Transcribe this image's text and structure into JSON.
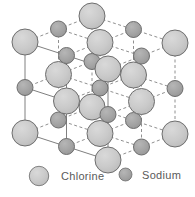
{
  "figure": {
    "type": "ball-and-stick-lattice",
    "projection": "isometric",
    "background": "#ffffff"
  },
  "atoms": {
    "chlorine": {
      "name": "Chlorine",
      "radius": 13,
      "fill": "#c9c9c9",
      "stroke": "#6e6e6e",
      "highlight": "#d8d8d8"
    },
    "sodium": {
      "name": "Sodium",
      "radius": 8,
      "fill": "#a3a3a3",
      "stroke": "#6e6e6e",
      "highlight": "#b4b4b4"
    }
  },
  "bonds": {
    "solid_color": "#808080",
    "dashed_color": "#909090",
    "width": 1,
    "dash": "3,2.5"
  },
  "lattice": {
    "grid": [
      3,
      3,
      3
    ],
    "axes": {
      "x": [
        41.5,
        13.5
      ],
      "y": [
        33.5,
        -13.0
      ],
      "z": [
        0,
        45.5
      ]
    },
    "origin": [
      25,
      42
    ],
    "sites": [
      {
        "i": 0,
        "j": 0,
        "k": 0,
        "el": "chlorine",
        "x": 25,
        "y": 42
      },
      {
        "i": 1,
        "j": 0,
        "k": 0,
        "el": "sodium",
        "x": 66.5,
        "y": 55.5
      },
      {
        "i": 2,
        "j": 0,
        "k": 0,
        "el": "chlorine",
        "x": 108,
        "y": 69
      },
      {
        "i": 0,
        "j": 1,
        "k": 0,
        "el": "sodium",
        "x": 58.5,
        "y": 29
      },
      {
        "i": 1,
        "j": 1,
        "k": 0,
        "el": "chlorine",
        "x": 100,
        "y": 42.5
      },
      {
        "i": 2,
        "j": 1,
        "k": 0,
        "el": "sodium",
        "x": 141.5,
        "y": 56
      },
      {
        "i": 0,
        "j": 2,
        "k": 0,
        "el": "chlorine",
        "x": 92,
        "y": 16
      },
      {
        "i": 1,
        "j": 2,
        "k": 0,
        "el": "sodium",
        "x": 133.5,
        "y": 29.5
      },
      {
        "i": 2,
        "j": 2,
        "k": 0,
        "el": "chlorine",
        "x": 175,
        "y": 43
      },
      {
        "i": 0,
        "j": 0,
        "k": 1,
        "el": "sodium",
        "x": 25,
        "y": 87.5
      },
      {
        "i": 1,
        "j": 0,
        "k": 1,
        "el": "chlorine",
        "x": 66.5,
        "y": 101
      },
      {
        "i": 2,
        "j": 0,
        "k": 1,
        "el": "sodium",
        "x": 108,
        "y": 114.5
      },
      {
        "i": 0,
        "j": 1,
        "k": 1,
        "el": "chlorine",
        "x": 58.5,
        "y": 74.5
      },
      {
        "i": 1,
        "j": 1,
        "k": 1,
        "el": "sodium",
        "x": 100,
        "y": 88
      },
      {
        "i": 2,
        "j": 1,
        "k": 1,
        "el": "chlorine",
        "x": 141.5,
        "y": 101.5
      },
      {
        "i": 0,
        "j": 2,
        "k": 1,
        "el": "sodium",
        "x": 92,
        "y": 61.5
      },
      {
        "i": 1,
        "j": 2,
        "k": 1,
        "el": "chlorine",
        "x": 133.5,
        "y": 75
      },
      {
        "i": 2,
        "j": 2,
        "k": 1,
        "el": "sodium",
        "x": 175,
        "y": 88.5
      },
      {
        "i": 0,
        "j": 0,
        "k": 2,
        "el": "chlorine",
        "x": 25,
        "y": 133
      },
      {
        "i": 1,
        "j": 0,
        "k": 2,
        "el": "sodium",
        "x": 66.5,
        "y": 146.5
      },
      {
        "i": 2,
        "j": 0,
        "k": 2,
        "el": "chlorine",
        "x": 108,
        "y": 160
      },
      {
        "i": 0,
        "j": 1,
        "k": 2,
        "el": "sodium",
        "x": 58.5,
        "y": 120
      },
      {
        "i": 1,
        "j": 1,
        "k": 2,
        "el": "chlorine",
        "x": 100,
        "y": 133.5
      },
      {
        "i": 2,
        "j": 1,
        "k": 2,
        "el": "sodium",
        "x": 141.5,
        "y": 147
      },
      {
        "i": 0,
        "j": 2,
        "k": 2,
        "el": "chlorine",
        "x": 92,
        "y": 107
      },
      {
        "i": 1,
        "j": 2,
        "k": 2,
        "el": "sodium",
        "x": 133.5,
        "y": 120.5
      },
      {
        "i": 2,
        "j": 2,
        "k": 2,
        "el": "chlorine",
        "x": 175,
        "y": 134
      }
    ]
  },
  "legend": {
    "chlorine_label": "Chlorine",
    "sodium_label": "Sodium",
    "text_color": "#5a5a5a"
  }
}
